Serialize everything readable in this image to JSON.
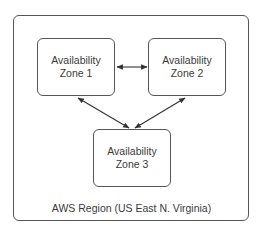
{
  "diagram": {
    "region": {
      "label": "AWS Region (US East N. Virginia)"
    },
    "zones": [
      {
        "id": "z1",
        "line1": "Availability",
        "line2": "Zone 1"
      },
      {
        "id": "z2",
        "line1": "Availability",
        "line2": "Zone 2"
      },
      {
        "id": "z3",
        "line1": "Availability",
        "line2": "Zone 3"
      }
    ],
    "connections": [
      {
        "from": "Zone 1",
        "to": "Zone 2",
        "type": "bidirectional"
      },
      {
        "from": "Zone 1",
        "to": "Zone 3",
        "type": "bidirectional"
      },
      {
        "from": "Zone 2",
        "to": "Zone 3",
        "type": "bidirectional"
      }
    ],
    "colors": {
      "stroke": "#555555",
      "text": "#3a3a3a",
      "background": "#ffffff"
    }
  }
}
